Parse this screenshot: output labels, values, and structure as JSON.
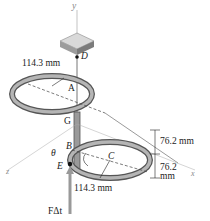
{
  "labels": {
    "y_axis": "y",
    "x_axis": "x",
    "z_axis": "z",
    "point_D": "D",
    "point_A": "A",
    "point_G": "G",
    "point_B": "B",
    "point_C": "C",
    "point_E": "E",
    "theta": "θ",
    "top_radius": "114.3 mm",
    "bottom_radius": "114.3 mm",
    "upper_height": "76.2 mm",
    "lower_height_value": "76.2",
    "lower_height_unit": "mm",
    "impulse": "FΔt"
  },
  "colors": {
    "ring": "#8a8a8a",
    "ring_dark": "#555555",
    "block": "#a8a8a8",
    "axis": "#9a9a9a",
    "text": "#222222"
  }
}
